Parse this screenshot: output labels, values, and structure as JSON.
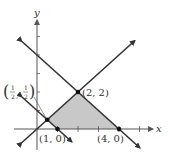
{
  "figure": {
    "type": "linear-programming-feasible-region",
    "axes": {
      "x_label": "x",
      "y_label": "y",
      "origin_px": [
        37,
        129
      ],
      "units_px": {
        "x": 20.5,
        "y": 18.5
      },
      "x_ticks": [
        1,
        2,
        3,
        4,
        5
      ],
      "y_ticks": [
        1,
        2,
        3,
        4,
        5
      ]
    },
    "lines": [
      {
        "name": "y = x",
        "from": [
          -0.73,
          -0.73
        ],
        "to": [
          4.78,
          4.78
        ]
      },
      {
        "name": "x + y = 4",
        "from": [
          -0.73,
          4.73
        ],
        "to": [
          5.02,
          -1.02
        ]
      },
      {
        "name": "x + y = 1",
        "from": [
          -0.73,
          1.73
        ],
        "to": [
          1.71,
          -0.71
        ]
      }
    ],
    "region": {
      "vertices": [
        [
          0.5,
          0.5
        ],
        [
          2,
          2
        ],
        [
          4,
          0
        ],
        [
          1,
          0
        ]
      ],
      "fill": "#c8c8c8"
    },
    "points": [
      {
        "label": "(2, 2)",
        "x": 2,
        "y": 2
      },
      {
        "label": "(1, 0)",
        "x": 1,
        "y": 0
      },
      {
        "label": "(4, 0)",
        "x": 4,
        "y": 0
      },
      {
        "label_num": "1",
        "label_den": "2",
        "x": 0.5,
        "y": 0.5
      }
    ],
    "colors": {
      "line": "#333333",
      "shade": "#c8c8c8",
      "axis": "#555555"
    }
  },
  "labels": {
    "x_axis": "x",
    "y_axis": "y",
    "p22": "(2, 2)",
    "p10": "(1, 0)",
    "p40": "(4, 0)",
    "half_num": "1",
    "half_den": "2",
    "half_comma": ","
  }
}
